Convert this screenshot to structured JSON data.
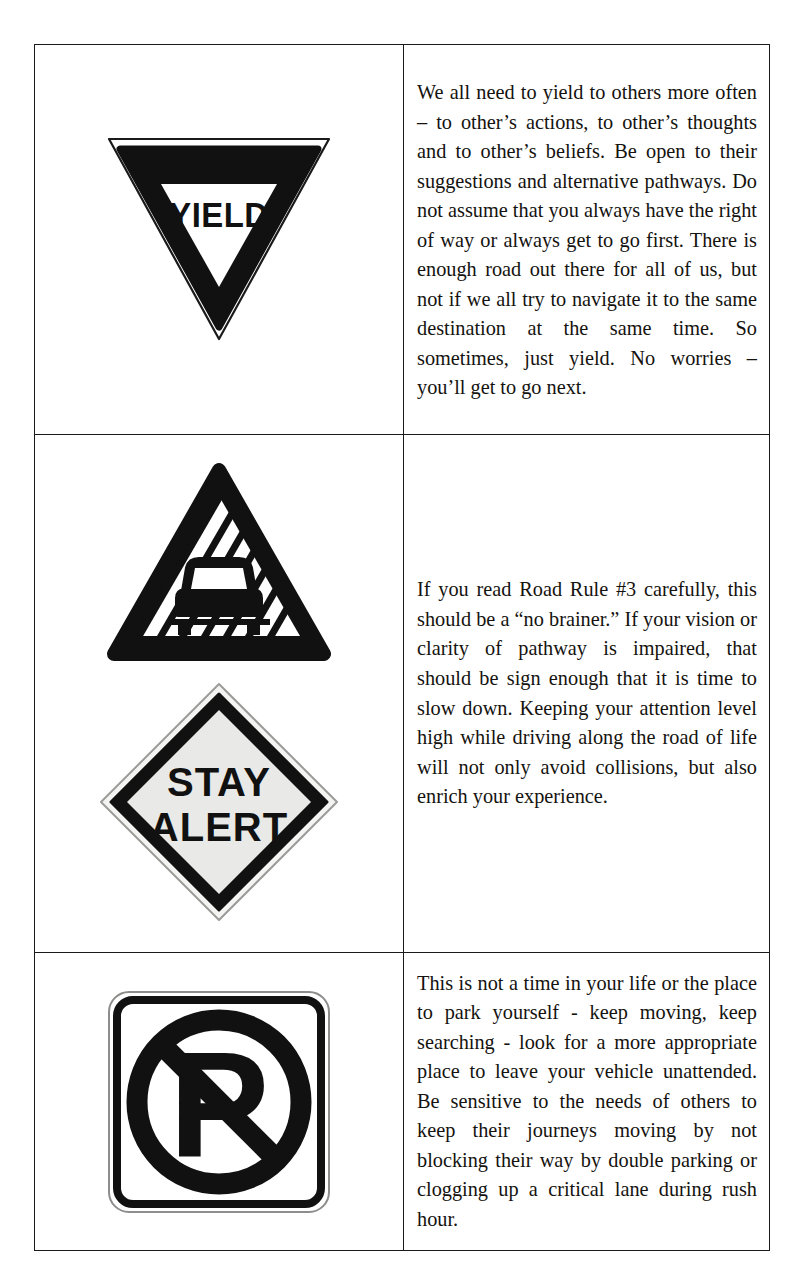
{
  "document": {
    "type": "road-rules-table",
    "layout": "two-column table, three rows: sign image left, explanatory text right",
    "background_color": "#ffffff",
    "ink_color": "#15130f",
    "border_color": "#1a1a1a"
  },
  "rows": [
    {
      "sign": {
        "name": "yield-sign",
        "shape": "inverted-triangle",
        "label": "YIELD",
        "fill_color": "#ffffff",
        "border_color": "#111111"
      },
      "text": "We all need to yield to others more often – to other’s actions, to other’s thoughts and to other’s beliefs.  Be open to their suggestions and alternative pathways.  Do not assume that you always have the right of way or always get to go first.  There is enough road out there for all of us, but not if we all try to navigate it to the same destination at the same time.  So sometimes, just yield.  No worries – you’ll get to go next."
    },
    {
      "sign": {
        "name": "slippery-road-sign",
        "shape": "triangle",
        "label": "",
        "fill_color": "#ffffff",
        "border_color": "#111111"
      },
      "sign2": {
        "name": "stay-alert-sign",
        "shape": "diamond",
        "label_line1": "STAY",
        "label_line2": "ALERT",
        "fill_color": "#e9e9e7",
        "border_color": "#111111"
      },
      "text": "If you read Road Rule #3 carefully, this should be a “no brainer.” If your vision or clarity of pathway is impaired, that should be sign enough that it is time to slow down. Keeping your attention level high while driving along the road of life will not only avoid collisions, but also enrich your experience."
    },
    {
      "sign": {
        "name": "no-parking-sign",
        "shape": "rounded-square",
        "label": "P",
        "fill_color": "#ffffff",
        "border_color": "#111111"
      },
      "text": "This is not a time in your life or the place to park yourself - keep moving, keep searching - look for a more appropriate place to leave your vehicle unattended. Be sensitive to the needs of others to keep their journeys moving by not blocking their way by double parking or clogging up a critical lane during rush hour."
    }
  ]
}
